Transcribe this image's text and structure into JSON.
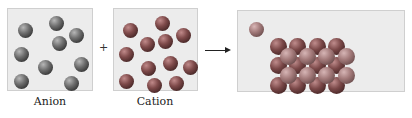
{
  "diagram": {
    "type": "ionic-compound-formation",
    "operator_plus": "+",
    "arrow": "→",
    "panels": [
      {
        "id": "anion",
        "label": "Anion",
        "particle_count": 10
      },
      {
        "id": "cation",
        "label": "Cation",
        "particle_count": 13
      },
      {
        "id": "product",
        "label": "",
        "lattice_dark_count": 12,
        "lattice_light_count": 8,
        "free_particles": 1
      }
    ],
    "colors": {
      "box_background": "#ececec",
      "box_border": "#cfcfcf",
      "anion_sphere": "#5a5a5a",
      "cation_sphere": "#6a3d3d",
      "lattice_light_sphere": "#a27979"
    }
  },
  "labels": {
    "anion": "Anion",
    "cation": "Cation",
    "plus": "+"
  }
}
